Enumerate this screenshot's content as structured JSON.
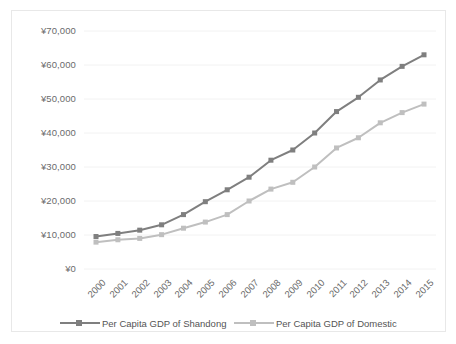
{
  "chart_data": {
    "type": "line",
    "title": "",
    "subtitle": "",
    "xlabel": "",
    "ylabel": "",
    "categories": [
      "2000",
      "2001",
      "2002",
      "2003",
      "2004",
      "2005",
      "2006",
      "2007",
      "2008",
      "2009",
      "2010",
      "2011",
      "2012",
      "2013",
      "2014",
      "2015"
    ],
    "ytick_labels": [
      "¥70,000",
      "¥60,000",
      "¥50,000",
      "¥40,000",
      "¥30,000",
      "¥20,000",
      "¥10,000",
      "¥0"
    ],
    "ytick_values": [
      70000,
      60000,
      50000,
      40000,
      30000,
      20000,
      10000,
      0
    ],
    "ylim": [
      0,
      70000
    ],
    "grid": true,
    "legend_position": "bottom",
    "series": [
      {
        "name": "Per Capita GDP of Shandong",
        "color": "#7f7f7f",
        "marker": "square",
        "values": [
          9555,
          10465,
          11423,
          13000,
          16000,
          19800,
          23300,
          27000,
          32000,
          35000,
          40000,
          46300,
          50500,
          55600,
          59600,
          63000
        ]
      },
      {
        "name": "Per Capita GDP of Domestic",
        "color": "#bfbfbf",
        "marker": "square",
        "values": [
          7900,
          8600,
          9000,
          10100,
          12000,
          13800,
          16000,
          20000,
          23500,
          25500,
          30000,
          35600,
          38600,
          43000,
          46000,
          48500
        ]
      }
    ]
  },
  "legend": {
    "items": [
      {
        "label": "Per Capita GDP of Shandong",
        "color": "#7f7f7f"
      },
      {
        "label": "Per Capita GDP of Domestic",
        "color": "#bfbfbf"
      }
    ]
  },
  "colors": {
    "series_shandong": "#7f7f7f",
    "series_domestic": "#bfbfbf",
    "gridline": "#f2f2f2",
    "border": "#e8e8e8",
    "tick_text": "#6b6b6b"
  }
}
